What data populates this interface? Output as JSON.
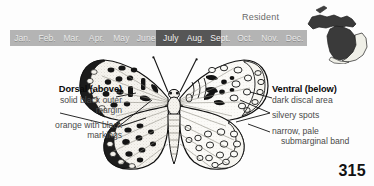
{
  "figure": {
    "page_number": "315",
    "residency_status": "Resident",
    "colors": {
      "bar_base": "#b4b4b4",
      "bar_peak": "#565656",
      "month_text": "#e9e9e9",
      "label_text": "#4a4a4a",
      "heading_text": "#0a0a0a",
      "map_range_fill": "#3a3a3a",
      "background": "#fdfdfd"
    }
  },
  "flight_period": {
    "months": [
      "Jan.",
      "Feb.",
      "Mar.",
      "Apr.",
      "May",
      "June",
      "July",
      "Aug.",
      "Sept.",
      "Oct.",
      "Nov.",
      "Dec."
    ],
    "peak_start_month": "June",
    "peak_end_month": "Sept.",
    "peak_start_pct": 49,
    "peak_end_pct": 71
  },
  "range_map": {
    "region_name": "Michigan",
    "icon": "michigan-range-map-icon",
    "upper_peninsula_shaded": true,
    "lower_peninsula_shaded": true
  },
  "dorsal": {
    "heading": "Dorsal (above)",
    "notes": [
      "solid black outer",
      "margin",
      "orange with black",
      "markings"
    ]
  },
  "ventral": {
    "heading": "Ventral (below)",
    "notes": [
      "dark discal area",
      "silvery spots",
      "narrow, pale",
      "submarginal band"
    ]
  },
  "illustration": {
    "subject": "butterfly-specimen-illustration",
    "left_wing_view": "dorsal",
    "right_wing_view": "ventral"
  },
  "chart_data": {
    "type": "bar",
    "categories": [
      "Jan.",
      "Feb.",
      "Mar.",
      "Apr.",
      "May",
      "June",
      "July",
      "Aug.",
      "Sept.",
      "Oct.",
      "Nov.",
      "Dec."
    ],
    "values": [
      0,
      0,
      0,
      0,
      0,
      1,
      1,
      1,
      1,
      0,
      0,
      0
    ],
    "xlabel": "",
    "ylabel": "",
    "legend": [
      "peak flight"
    ],
    "grid": false
  }
}
